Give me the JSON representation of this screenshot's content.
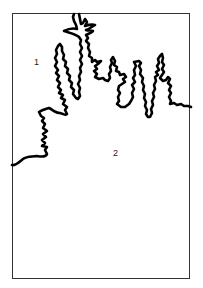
{
  "diagram": {
    "type": "figure-ground",
    "regions": [
      {
        "id": "region-1",
        "label": "1",
        "x": 34,
        "y": 58
      },
      {
        "id": "region-2",
        "label": "2",
        "x": 113,
        "y": 149
      }
    ],
    "colors": {
      "line": "#000000",
      "frame": "#333333",
      "background": "#ffffff"
    }
  }
}
